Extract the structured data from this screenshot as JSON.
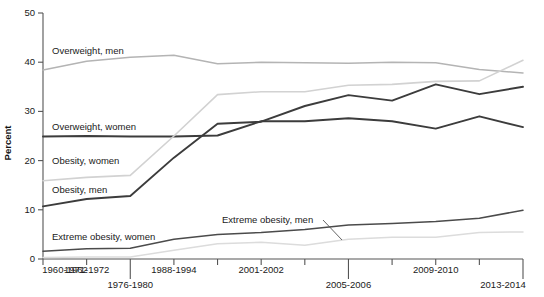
{
  "chart_data": {
    "type": "line",
    "title": "",
    "xlabel": "",
    "ylabel": "Percent",
    "ylim": [
      0,
      50
    ],
    "yticks": [
      0,
      10,
      20,
      30,
      40,
      50
    ],
    "ytick_labels": [
      "0",
      "10",
      "20",
      "30",
      "40",
      "50"
    ],
    "grid": false,
    "legend_position": "inline-labels",
    "categories": [
      "1960-1962",
      "1971-1974",
      "1976-1980",
      "1988-1994",
      "1999-2000",
      "2001-2002",
      "2003-2004",
      "2005-2006",
      "2007-2008",
      "2009-2010",
      "2011-2012",
      "2013-2014"
    ],
    "xtick_labels_shown": [
      "1960-1962",
      "1971-1972",
      "1976-1980",
      "1988-1994",
      "2001-2002",
      "2005-2006",
      "2009-2010",
      "2013-2014"
    ],
    "series": [
      {
        "name": "Overweight, men",
        "color": "#b4b4b4",
        "label": "Overweight, men",
        "values": [
          38.4,
          40.2,
          41.0,
          41.4,
          39.7,
          40.0,
          39.9,
          39.8,
          40.0,
          39.9,
          38.5,
          37.8
        ]
      },
      {
        "name": "Overweight, women",
        "color": "#3c3c3c",
        "label": "Overweight, women",
        "values": [
          24.9,
          25.0,
          24.9,
          24.9,
          25.1,
          28.0,
          28.0,
          28.6,
          28.0,
          26.5,
          29.0,
          26.8
        ]
      },
      {
        "name": "Obesity, women",
        "color": "#d2d2d2",
        "label": "Obesity, women",
        "values": [
          15.9,
          16.6,
          17.0,
          25.0,
          33.4,
          34.0,
          34.0,
          35.3,
          35.5,
          36.1,
          36.2,
          40.4
        ]
      },
      {
        "name": "Obesity, men",
        "color": "#3c3c3c",
        "label": "Obesity, men",
        "values": [
          10.7,
          12.2,
          12.8,
          20.6,
          27.5,
          27.9,
          31.1,
          33.3,
          32.2,
          35.5,
          33.5,
          35.0
        ]
      },
      {
        "name": "Extreme obesity, women",
        "color": "#4b4b4b",
        "label": "Extreme obesity, women",
        "values": [
          1.6,
          2.1,
          2.2,
          4.0,
          5.0,
          5.4,
          6.0,
          6.9,
          7.2,
          7.6,
          8.3,
          9.9
        ]
      },
      {
        "name": "Extreme obesity, men",
        "color": "#dcdcdc",
        "label": "Extreme obesity, men",
        "values": [
          0.3,
          0.4,
          0.4,
          1.8,
          3.1,
          3.4,
          2.8,
          4.0,
          4.4,
          4.4,
          5.4,
          5.5
        ]
      }
    ],
    "annotations": [
      {
        "text": "Overweight, men",
        "series": "Overweight, men"
      },
      {
        "text": "Overweight, women",
        "series": "Overweight, women"
      },
      {
        "text": "Obesity, women",
        "series": "Obesity, women"
      },
      {
        "text": "Obesity, men",
        "series": "Obesity, men"
      },
      {
        "text": "Extreme obesity, women",
        "series": "Extreme obesity, women"
      },
      {
        "text": "Extreme obesity, men",
        "series": "Extreme obesity, men",
        "leader": true
      }
    ]
  }
}
